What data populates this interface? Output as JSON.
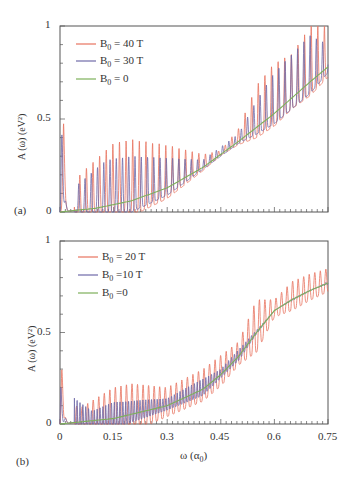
{
  "chart_data": [
    {
      "type": "line",
      "panel_label": "(a)",
      "title": "",
      "xlabel": "",
      "ylabel": "A (ω) (eV²)",
      "xlim": [
        0,
        0.75
      ],
      "ylim": [
        0,
        1
      ],
      "yticks": [
        "0",
        "0.5",
        "1"
      ],
      "xticks": [],
      "grid": false,
      "legend_position": "upper left",
      "series": [
        {
          "name": "B0 = 40 T",
          "label_main": "B",
          "label_sub": "0",
          "label_rest": " = 40 T",
          "color": "#e8735f",
          "description": "Sharp oscillatory peaks; spike ~0.47 at ω≈0.01, ~0.2 at ω≈0.06; periodic peaks ~0.3–0.4 from ω≈0.15 to 0.45, growing oscillations to ~1.0 near ω≈0.7–0.75",
          "x": [
            0.0,
            0.01,
            0.02,
            0.06,
            0.15,
            0.2,
            0.3,
            0.4,
            0.45,
            0.5,
            0.55,
            0.6,
            0.65,
            0.7,
            0.75
          ],
          "y_peak": [
            0.0,
            0.47,
            0.12,
            0.21,
            0.37,
            0.39,
            0.36,
            0.31,
            0.33,
            0.45,
            0.68,
            0.8,
            0.85,
            1.0,
            1.0
          ]
        },
        {
          "name": "B0 = 30 T",
          "label_main": "B",
          "label_sub": "0",
          "label_rest": " = 30 T",
          "color": "#6f6aa8",
          "description": "Oscillatory peaks slightly lower than 40 T; spike ~0.42 at ω≈0.005, ~0.14 at ω≈0.045; peaks ~0.3 mid-range, up to ~0.95 near ω≈0.72",
          "x": [
            0.0,
            0.005,
            0.045,
            0.13,
            0.2,
            0.3,
            0.4,
            0.5,
            0.55,
            0.6,
            0.7,
            0.75
          ],
          "y_peak": [
            0.0,
            0.42,
            0.14,
            0.28,
            0.3,
            0.29,
            0.28,
            0.42,
            0.6,
            0.75,
            0.95,
            0.9
          ]
        },
        {
          "name": "B0 = 0",
          "label_main": "B",
          "label_sub": "0",
          "label_rest": " = 0",
          "color": "#7db05a",
          "description": "Smooth monotonically increasing curve",
          "x": [
            0.0,
            0.1,
            0.2,
            0.3,
            0.4,
            0.5,
            0.6,
            0.7,
            0.75
          ],
          "y": [
            0.0,
            0.02,
            0.06,
            0.13,
            0.24,
            0.38,
            0.53,
            0.7,
            0.78
          ]
        }
      ]
    },
    {
      "type": "line",
      "panel_label": "(b)",
      "title": "",
      "xlabel": "ω (α₀)",
      "ylabel": "A (ω) (eV²)",
      "xlim": [
        0,
        0.75
      ],
      "ylim": [
        0,
        1
      ],
      "yticks": [
        "0",
        "0.5",
        "1"
      ],
      "xticks": [
        "0",
        "0.15",
        "0.3",
        "0.45",
        "0.6",
        "0.75"
      ],
      "grid": false,
      "legend_position": "upper left",
      "series": [
        {
          "name": "B0 = 20 T",
          "label_main": "B",
          "label_sub": "0",
          "label_rest": " = 20 T",
          "color": "#e8735f",
          "description": "Oscillations around smooth curve; spike ~0.3 at ω≈0.005; peaks ~0.2 around ω≈0.15–0.3; amplitude bursts near ω≈0.4, 0.55, 0.65; reaches ~0.85 at 0.75",
          "x": [
            0.0,
            0.005,
            0.05,
            0.15,
            0.2,
            0.3,
            0.4,
            0.5,
            0.55,
            0.6,
            0.65,
            0.7,
            0.75
          ],
          "y_peak": [
            0.0,
            0.3,
            0.08,
            0.2,
            0.22,
            0.2,
            0.3,
            0.45,
            0.68,
            0.68,
            0.78,
            0.82,
            0.85
          ]
        },
        {
          "name": "B0 = 10 T",
          "label_main": "B",
          "label_sub": "0",
          "label_rest": " =10 T",
          "color": "#6f6aa8",
          "description": "Dense small oscillations closely following smooth curve; spike ~0.2 at ω≈0.002",
          "x": [
            0.0,
            0.002,
            0.09,
            0.15,
            0.3,
            0.45,
            0.6,
            0.75
          ],
          "y_peak": [
            0.0,
            0.2,
            0.07,
            0.12,
            0.14,
            0.3,
            0.62,
            0.78
          ]
        },
        {
          "name": "B0 = 0",
          "label_main": "B",
          "label_sub": "0",
          "label_rest": " =0",
          "color": "#7db05a",
          "description": "Smooth increasing step-like curve",
          "x": [
            0.0,
            0.15,
            0.3,
            0.4,
            0.45,
            0.5,
            0.55,
            0.6,
            0.65,
            0.7,
            0.75
          ],
          "y": [
            0.0,
            0.03,
            0.1,
            0.19,
            0.27,
            0.37,
            0.5,
            0.62,
            0.68,
            0.73,
            0.77
          ]
        }
      ]
    }
  ],
  "panels": {
    "a": {
      "tag": "(a)",
      "ylabel": "A (ω) (eV²)",
      "ytick_0": "0",
      "ytick_05": "0.5",
      "ytick_1": "1",
      "legend": [
        {
          "main": "B",
          "sub": "0",
          "rest": " = 40 T"
        },
        {
          "main": "B",
          "sub": "0",
          "rest": " = 30 T"
        },
        {
          "main": "B",
          "sub": "0",
          "rest": " = 0"
        }
      ]
    },
    "b": {
      "tag": "(b)",
      "ylabel": "A (ω) (eV²)",
      "xlabel_main": "ω (α",
      "xlabel_sub": "0",
      "xlabel_close": ")",
      "ytick_0": "0",
      "ytick_05": "0.5",
      "ytick_1": "1",
      "xticks": [
        "0",
        "0.15",
        "0.3",
        "0.45",
        "0.6",
        "0.75"
      ],
      "legend": [
        {
          "main": "B",
          "sub": "0",
          "rest": " = 20 T"
        },
        {
          "main": "B",
          "sub": "0",
          "rest": " =10 T"
        },
        {
          "main": "B",
          "sub": "0",
          "rest": " =0"
        }
      ]
    }
  },
  "colors": {
    "red": "#e8735f",
    "purple": "#6f6aa8",
    "green": "#7db05a",
    "axis": "#555555"
  }
}
